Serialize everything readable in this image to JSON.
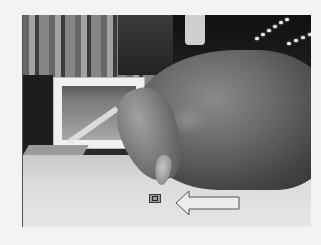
{
  "image": {
    "type": "photograph",
    "colormode": "grayscale",
    "subject": "hand pressing a small component on a table surface",
    "annotation": {
      "marker": "small square target",
      "arrow_direction": "left",
      "arrow_style": "outlined block arrow"
    },
    "colors": {
      "page_background": "#f3f3f3",
      "arrow_fill": "#ececec",
      "arrow_stroke": "#555555",
      "marker_stroke": "#3a3a3a"
    }
  }
}
